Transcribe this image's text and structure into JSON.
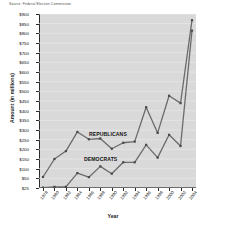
{
  "source_note": "Source: Federal Election Commission",
  "chart_data": {
    "type": "line",
    "title": "",
    "subtitle": "",
    "xlabel": "Year",
    "ylabel": "Amount (in millions)",
    "x": [
      1978,
      1980,
      1982,
      1984,
      1986,
      1988,
      1990,
      1992,
      1994,
      1996,
      1998,
      2000,
      2002,
      2004
    ],
    "categories": [
      "1978",
      "1980",
      "1982",
      "1984",
      "1986",
      "1988",
      "1990",
      "1992",
      "1994",
      "1996",
      "1998",
      "2000",
      "2002",
      "2004"
    ],
    "series": [
      {
        "name": "REPUBLICANS",
        "color": "#6b6b6b",
        "values": [
          57,
          150,
          191,
          290,
          252,
          256,
          203,
          234,
          240,
          418,
          285,
          477,
          439,
          868
        ]
      },
      {
        "name": "DEMOCRATS",
        "color": "#6b6b6b",
        "values": [
          26,
          28,
          28,
          77,
          56,
          112,
          74,
          133,
          133,
          223,
          157,
          275,
          217,
          814
        ]
      }
    ],
    "ylim": [
      25,
      900
    ],
    "ytick_labels": [
      "$900",
      "$850",
      "$800",
      "$750",
      "$700",
      "$650",
      "$600",
      "$550",
      "$500",
      "$450",
      "$400",
      "$350",
      "$300",
      "$250",
      "$200",
      "$150",
      "$100",
      "$50",
      "$25"
    ],
    "ytick_values": [
      900,
      850,
      800,
      750,
      700,
      650,
      600,
      550,
      500,
      450,
      400,
      350,
      300,
      250,
      200,
      150,
      100,
      50,
      25
    ],
    "grid": true,
    "grid_axis": "y",
    "legend": "inline-annotations",
    "legend_position": "none",
    "annotations": [
      {
        "text": "REPUBLICANS",
        "near_x": 1986,
        "near_y": 280
      },
      {
        "text": "DEMOCRATS",
        "near_x": 1986,
        "near_y": 140
      }
    ],
    "plot_background": "#d9d9d9",
    "marker": "square",
    "line_color": "#6b6b6b"
  }
}
